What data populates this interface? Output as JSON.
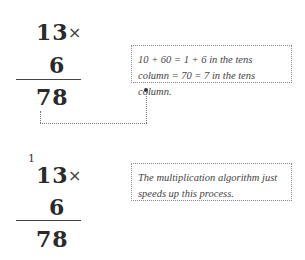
{
  "example1": {
    "multiplicand": "13",
    "operator": "×",
    "multiplier": "6",
    "product": "78",
    "note": "10 + 60 = 1 + 6 in the tens column = 70 = 7 in the tens column."
  },
  "example2": {
    "carry": "1",
    "multiplicand": "13",
    "operator": "×",
    "multiplier": "6",
    "product": "78",
    "note": "The multiplication algorithm just speeds up this process."
  }
}
